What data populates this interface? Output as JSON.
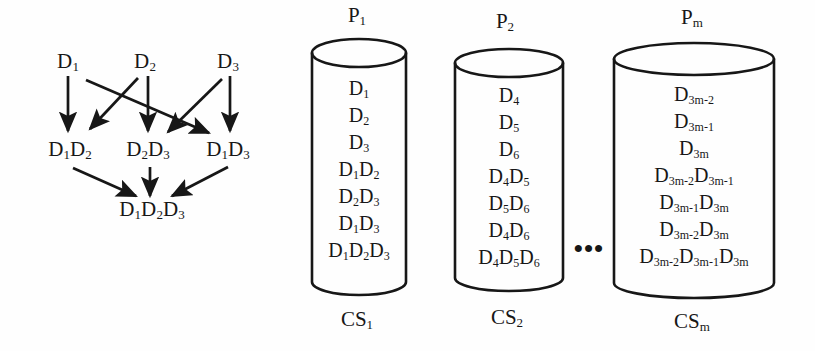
{
  "figure": {
    "background_color": "#fefefe",
    "ink_color": "#171717",
    "lattice": {
      "name": "data-cube-lattice",
      "levels": [
        {
          "level": 1,
          "nodes": [
            {
              "id": "D1",
              "base": "D",
              "sub": "1",
              "x": 68,
              "y": 62
            },
            {
              "id": "D2",
              "base": "D",
              "sub": "2",
              "x": 145,
              "y": 62
            },
            {
              "id": "D3",
              "base": "D",
              "sub": "3",
              "x": 228,
              "y": 62
            }
          ]
        },
        {
          "level": 2,
          "nodes": [
            {
              "id": "D1D2",
              "label": "D1D2",
              "x": 70,
              "y": 150
            },
            {
              "id": "D2D3",
              "label": "D2D3",
              "x": 148,
              "y": 150
            },
            {
              "id": "D1D3",
              "label": "D1D3",
              "x": 228,
              "y": 150
            }
          ]
        },
        {
          "level": 3,
          "nodes": [
            {
              "id": "D1D2D3",
              "label": "D1D2D3",
              "x": 152,
              "y": 210
            }
          ]
        }
      ],
      "edges": [
        {
          "from": "D1",
          "to": "D1D2"
        },
        {
          "from": "D1",
          "to": "D1D3"
        },
        {
          "from": "D2",
          "to": "D1D2"
        },
        {
          "from": "D2",
          "to": "D2D3"
        },
        {
          "from": "D3",
          "to": "D2D3"
        },
        {
          "from": "D3",
          "to": "D1D3"
        },
        {
          "from": "D1D2",
          "to": "D1D2D3"
        },
        {
          "from": "D2D3",
          "to": "D1D2D3"
        },
        {
          "from": "D1D3",
          "to": "D1D2D3"
        }
      ]
    },
    "cylinders": [
      {
        "id": "cyl-1",
        "top_label": {
          "base": "P",
          "sub": "1"
        },
        "bottom_label": {
          "base": "CS",
          "sub": "1"
        },
        "items": [
          {
            "base": "D",
            "sub": "1"
          },
          {
            "base": "D",
            "sub": "2"
          },
          {
            "base": "D",
            "sub": "3"
          },
          {
            "parts": [
              {
                "base": "D",
                "sub": "1"
              },
              {
                "base": "D",
                "sub": "2"
              }
            ]
          },
          {
            "parts": [
              {
                "base": "D",
                "sub": "2"
              },
              {
                "base": "D",
                "sub": "3"
              }
            ]
          },
          {
            "parts": [
              {
                "base": "D",
                "sub": "1"
              },
              {
                "base": "D",
                "sub": "3"
              }
            ]
          },
          {
            "parts": [
              {
                "base": "D",
                "sub": "1"
              },
              {
                "base": "D",
                "sub": "2"
              },
              {
                "base": "D",
                "sub": "3"
              }
            ]
          }
        ]
      },
      {
        "id": "cyl-2",
        "top_label": {
          "base": "P",
          "sub": "2"
        },
        "bottom_label": {
          "base": "CS",
          "sub": "2"
        },
        "items": [
          {
            "base": "D",
            "sub": "4"
          },
          {
            "base": "D",
            "sub": "5"
          },
          {
            "base": "D",
            "sub": "6"
          },
          {
            "parts": [
              {
                "base": "D",
                "sub": "4"
              },
              {
                "base": "D",
                "sub": "5"
              }
            ]
          },
          {
            "parts": [
              {
                "base": "D",
                "sub": "5"
              },
              {
                "base": "D",
                "sub": "6"
              }
            ]
          },
          {
            "parts": [
              {
                "base": "D",
                "sub": "4"
              },
              {
                "base": "D",
                "sub": "6"
              }
            ]
          },
          {
            "parts": [
              {
                "base": "D",
                "sub": "4"
              },
              {
                "base": "D",
                "sub": "5"
              },
              {
                "base": "D",
                "sub": "6"
              }
            ]
          }
        ]
      },
      {
        "id": "cyl-m",
        "top_label": {
          "base": "P",
          "sub": "m"
        },
        "bottom_label": {
          "base": "CS",
          "sub": "m"
        },
        "items": [
          {
            "base": "D",
            "sub": "3m-2"
          },
          {
            "base": "D",
            "sub": "3m-1"
          },
          {
            "base": "D",
            "sub": "3m"
          },
          {
            "parts": [
              {
                "base": "D",
                "sub": "3m-2"
              },
              {
                "base": "D",
                "sub": "3m-1"
              }
            ]
          },
          {
            "parts": [
              {
                "base": "D",
                "sub": "3m-1"
              },
              {
                "base": "D",
                "sub": "3m"
              }
            ]
          },
          {
            "parts": [
              {
                "base": "D",
                "sub": "3m-2"
              },
              {
                "base": "D",
                "sub": "3m"
              }
            ]
          },
          {
            "parts": [
              {
                "base": "D",
                "sub": "3m-2"
              },
              {
                "base": "D",
                "sub": "3m-1"
              },
              {
                "base": "D",
                "sub": "3m"
              }
            ]
          }
        ]
      }
    ],
    "ellipsis": {
      "text": "•••",
      "x": 589,
      "y": 249
    }
  }
}
